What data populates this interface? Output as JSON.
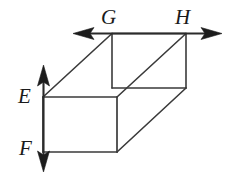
{
  "figure": {
    "type": "geometry-diagram",
    "width": 239,
    "height": 175,
    "background_color": "#ffffff",
    "stroke_color": "#2b2b2b",
    "label_color": "#1a1a1a",
    "labels": {
      "G": "G",
      "H": "H",
      "E": "E",
      "F": "F"
    },
    "points": {
      "G": {
        "x": 112,
        "y": 33
      },
      "H": {
        "x": 186,
        "y": 33
      },
      "E": {
        "x": 43,
        "y": 97
      },
      "F": {
        "x": 43,
        "y": 150
      }
    },
    "lines": {
      "horizontal_line": {
        "name": "line-GH",
        "y": 33,
        "x_start": 73,
        "x_end": 222,
        "arrow_left": true,
        "arrow_right": true
      },
      "vertical_line": {
        "name": "line-EF",
        "x": 43,
        "y_start": 65,
        "y_end": 172,
        "arrow_up": true,
        "arrow_down": true
      }
    },
    "box": {
      "name": "cuboid",
      "front_face": {
        "top_left": {
          "x": 43,
          "y": 97
        },
        "top_right": {
          "x": 117,
          "y": 97
        },
        "bottom_right": {
          "x": 117,
          "y": 152
        },
        "bottom_left": {
          "x": 43,
          "y": 152
        }
      },
      "back_face": {
        "top_left": {
          "x": 112,
          "y": 33
        },
        "top_right": {
          "x": 186,
          "y": 33
        },
        "bottom_right": {
          "x": 186,
          "y": 88
        },
        "bottom_left": {
          "x": 112,
          "y": 88
        }
      }
    }
  }
}
